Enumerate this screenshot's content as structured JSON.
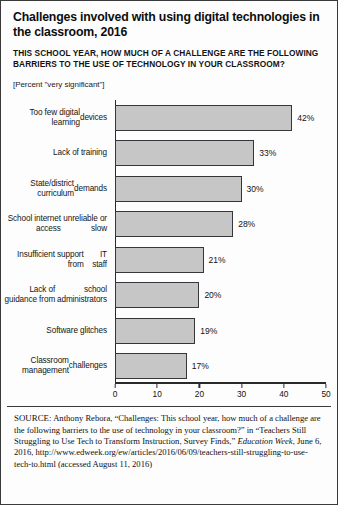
{
  "figure": {
    "title": "Challenges involved with using digital technologies in the classroom, 2016",
    "subtitle": "THIS SCHOOL YEAR, HOW MUCH OF A CHALLENGE ARE THE FOLLOWING BARRIERS TO THE USE OF TECHNOLOGY IN YOUR CLASSROOM?",
    "units_note": "[Percent \"very significant\"]"
  },
  "source": {
    "label": "SOURCE:",
    "text": " Anthony Rebora, “Challenges: This school year, how much of a challenge are the following barriers to the use of technology in your classroom?” in “Teachers Still Struggling to Use Tech to Transform Instruction, Survey Finds,” ",
    "publication": "Education Week",
    "text_after": ", June 6, 2016, http://www.edweek.org/ew/articles/2016/06/09/teachers-still-struggling-to-use-tech-to.html (accessed August 11, 2016)"
  },
  "chart_data": {
    "type": "bar",
    "orientation": "horizontal",
    "title": "Challenges involved with using digital technologies in the classroom, 2016",
    "subtitle": "THIS SCHOOL YEAR, HOW MUCH OF A CHALLENGE ARE THE FOLLOWING BARRIERS TO THE USE OF TECHNOLOGY IN YOUR CLASSROOM?",
    "xlabel": "",
    "ylabel": "",
    "xlim": [
      0,
      50
    ],
    "xticks": [
      0,
      10,
      20,
      30,
      40,
      50
    ],
    "xtick_labels": [
      "0",
      "10",
      "20",
      "30",
      "40",
      "50"
    ],
    "grid": false,
    "legend": false,
    "value_suffix": "%",
    "bar_color": "#c6c6c6",
    "bar_edge_color": "#35353a",
    "categories": [
      "Too few digital learning devices",
      "Lack of training",
      "State/district curriculum demands",
      "School internet access unreliable or slow",
      "Insufficient support from IT staff",
      "Lack of guidance from school administrators",
      "Software glitches",
      "Classroom management challenges"
    ],
    "values": [
      42,
      33,
      30,
      28,
      21,
      20,
      19,
      17
    ],
    "value_labels": [
      "42%",
      "33%",
      "30%",
      "28%",
      "21%",
      "20%",
      "19%",
      "17%"
    ],
    "category_lines": [
      [
        "Too few digital learning",
        "devices"
      ],
      [
        "Lack of training"
      ],
      [
        "State/district curriculum",
        "demands"
      ],
      [
        "School internet access",
        "unreliable or slow"
      ],
      [
        "Insufficient support from",
        "IT staff"
      ],
      [
        "Lack of guidance from",
        "school administrators"
      ],
      [
        "Software glitches"
      ],
      [
        "Classroom management",
        "challenges"
      ]
    ]
  }
}
